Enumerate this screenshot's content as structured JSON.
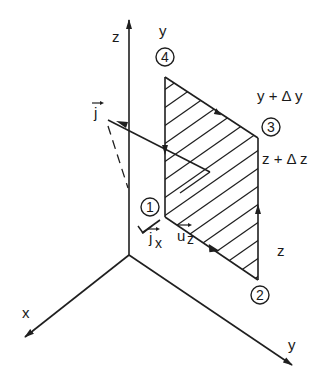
{
  "diagram": {
    "type": "3d-coordinate-surface-element",
    "axes": [
      {
        "name": "z-axis",
        "label": "z"
      },
      {
        "name": "x-axis",
        "label": "x"
      },
      {
        "name": "y-axis",
        "label": "y"
      }
    ],
    "corners": [
      {
        "id": "1",
        "label": "1"
      },
      {
        "id": "2",
        "label": "2"
      },
      {
        "id": "3",
        "label": "3"
      },
      {
        "id": "4",
        "label": "4"
      }
    ],
    "edge_labels": {
      "y": "y",
      "y_plus_dy": "y + Δ y",
      "z_plus_dz": "z + Δ z",
      "z": "z"
    },
    "vectors": {
      "j": "j",
      "jx": "j",
      "jx_sub": "x",
      "uz": "u",
      "uz_sub": "z"
    },
    "colors": {
      "ink": "#1f1f1f",
      "background": "#ffffff"
    }
  }
}
